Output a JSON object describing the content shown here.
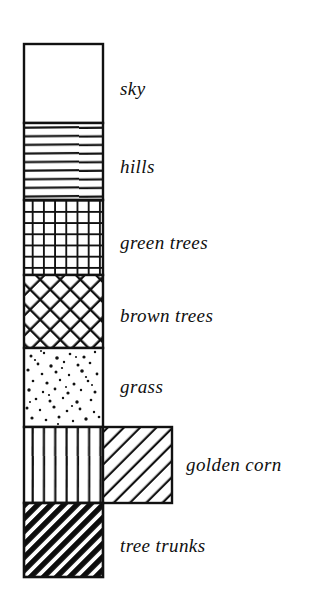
{
  "figure": {
    "kind": "texture-legend",
    "background_color": "#ffffff",
    "ink_color": "#101010",
    "column": {
      "x": 24,
      "y": 44,
      "width": 79,
      "right": 103
    },
    "swatches": [
      {
        "id": "sky",
        "label": "sky",
        "pattern": "blank",
        "pattern_name": "blank-white",
        "x": 24,
        "y": 44,
        "width": 79,
        "height": 79,
        "label_x": 120,
        "label_y": 90
      },
      {
        "id": "hills",
        "label": "hills",
        "pattern": "horizontal-lines",
        "pattern_name": "horizontal-ruled-lines",
        "x": 24,
        "y": 123,
        "width": 79,
        "height": 77,
        "label_x": 120,
        "label_y": 168
      },
      {
        "id": "green-trees",
        "label": "green trees",
        "pattern": "square-grid",
        "pattern_name": "orthogonal-grid-crosshatch",
        "x": 24,
        "y": 200,
        "width": 79,
        "height": 75,
        "label_x": 120,
        "label_y": 244
      },
      {
        "id": "brown-trees",
        "label": "brown trees",
        "pattern": "diagonal-crosshatch",
        "pattern_name": "diagonal-crosshatch-diamond",
        "x": 24,
        "y": 275,
        "width": 79,
        "height": 73,
        "label_x": 120,
        "label_y": 317
      },
      {
        "id": "grass",
        "label": "grass",
        "pattern": "stipple",
        "pattern_name": "random-stipple-dots",
        "x": 24,
        "y": 348,
        "width": 79,
        "height": 79,
        "label_x": 120,
        "label_y": 388
      },
      {
        "id": "golden-corn",
        "label": "golden corn",
        "pattern": "diagonal-lines",
        "pattern_name": "diagonal-hatch-rising",
        "x": 103,
        "y": 427,
        "width": 69,
        "height": 76,
        "companion_band": {
          "pattern": "vertical-lines",
          "pattern_name": "vertical-ruled-lines",
          "x": 24,
          "y": 427,
          "width": 79,
          "height": 76
        },
        "label_x": 186,
        "label_y": 466
      },
      {
        "id": "tree-trunks",
        "label": "tree trunks",
        "pattern": "dense-diagonal-hatch",
        "pattern_name": "heavy-diagonal-hatch-dark",
        "x": 24,
        "y": 503,
        "width": 79,
        "height": 74,
        "label_x": 120,
        "label_y": 547
      }
    ]
  }
}
